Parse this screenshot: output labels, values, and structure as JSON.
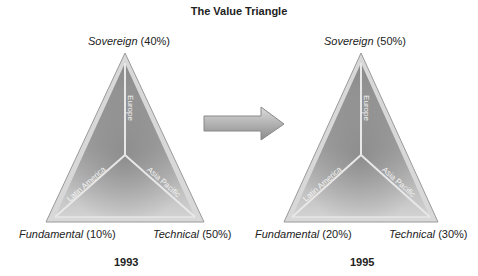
{
  "title": "The Value Triangle",
  "arrow": {
    "direction": "right"
  },
  "triangles": [
    {
      "year": "1993",
      "apex": {
        "name": "Sovereign",
        "pct": "(40%)"
      },
      "left": {
        "name": "Fundamental",
        "pct": "(10%)"
      },
      "right": {
        "name": "Technical",
        "pct": "(50%)"
      },
      "arms": {
        "top": "Europe",
        "left": "Latin America",
        "right": "Asia Pacific"
      }
    },
    {
      "year": "1995",
      "apex": {
        "name": "Sovereign",
        "pct": "(50%)"
      },
      "left": {
        "name": "Fundamental",
        "pct": "(20%)"
      },
      "right": {
        "name": "Technical",
        "pct": "(30%)"
      },
      "arms": {
        "top": "Europe",
        "left": "Latin America",
        "right": "Asia Pacific"
      }
    }
  ]
}
